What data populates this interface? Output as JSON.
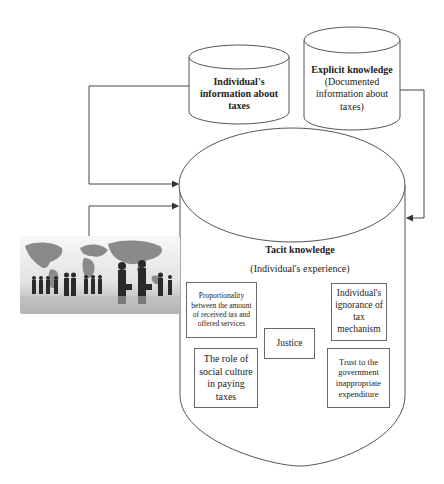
{
  "diagram": {
    "cylinders": {
      "individual_info": {
        "title": "Individual's information about taxes"
      },
      "explicit": {
        "title": "Explicit knowledge",
        "subtitle": "(Documented information about taxes)"
      },
      "tacit": {
        "title": "Tacit knowledge",
        "subtitle": "(Individual's experience)"
      }
    },
    "factors": [
      {
        "id": "proportionality",
        "label": "Proportionality between the amount of received tax and offered services"
      },
      {
        "id": "ignorance",
        "label": "Individual's ignorance of tax mechanism"
      },
      {
        "id": "justice",
        "label": "Justice"
      },
      {
        "id": "social_culture",
        "label": "The role of social culture in paying taxes"
      },
      {
        "id": "trust",
        "label": "Trust to the government inappropriate expenditure"
      }
    ],
    "image": {
      "icon": "world-map-business-people-silhouettes-image"
    },
    "colors": {
      "line": "#444444",
      "box_border": "#666666",
      "background": "#ffffff"
    }
  }
}
